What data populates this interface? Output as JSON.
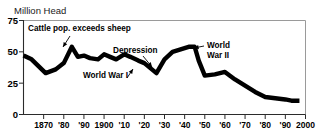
{
  "chart_data": {
    "type": "line",
    "title": "Million Head",
    "xlabel": "",
    "ylabel": "Million Head",
    "xlim": [
      1860,
      2000
    ],
    "ylim": [
      0,
      75
    ],
    "grid": false,
    "legend": null,
    "yticks": [
      0,
      25,
      50,
      75
    ],
    "ytick_labels": [
      "0",
      "25",
      "50",
      "75"
    ],
    "xticks": [
      1870,
      1880,
      1890,
      1900,
      1910,
      1920,
      1930,
      1940,
      1950,
      1960,
      1970,
      1980,
      1990,
      2000
    ],
    "xtick_labels": [
      "1870",
      "'80",
      "'90",
      "1900",
      "'10",
      "'20",
      "'30",
      "'40",
      "'50",
      "'60",
      "'70",
      "'80",
      "'90",
      "2000"
    ],
    "series": [
      {
        "name": "Sheep population",
        "color": "#000000",
        "x": [
          1860,
          1864,
          1871,
          1876,
          1880,
          1884,
          1887,
          1890,
          1893,
          1897,
          1900,
          1903,
          1906,
          1910,
          1913,
          1917,
          1920,
          1923,
          1926,
          1930,
          1934,
          1938,
          1942,
          1945,
          1947,
          1950,
          1955,
          1960,
          1965,
          1970,
          1975,
          1980,
          1985,
          1990,
          1993,
          1997
        ],
        "y": [
          47,
          44,
          33,
          36,
          41,
          54,
          46,
          47,
          45,
          44,
          48,
          46,
          44,
          48,
          46,
          43,
          41,
          37,
          33,
          44,
          50,
          52,
          54,
          54,
          43,
          31,
          32,
          34,
          28,
          23,
          18,
          14,
          13,
          12,
          11,
          11
        ]
      }
    ],
    "annotations": [
      {
        "id": "cattle-exceeds-sheep",
        "text": "Cattle pop. exceeds sheep",
        "text_x": 28,
        "text_y": 31,
        "arrow_from_x": 70,
        "arrow_from_y": 36,
        "arrow_to_x": 63,
        "arrow_to_y": 47
      },
      {
        "id": "depression",
        "text": "Depression",
        "text_x": 113,
        "text_y": 53,
        "arrow_from_x": 143,
        "arrow_from_y": 56,
        "arrow_to_x": 152,
        "arrow_to_y": 67
      },
      {
        "id": "world-war-1",
        "text": "World War I",
        "text_x": 83,
        "text_y": 78,
        "arrow_from_x": 127,
        "arrow_from_y": 78,
        "arrow_to_x": 133,
        "arrow_to_y": 69
      },
      {
        "id": "world-war-2-line-1",
        "text": "World",
        "text_x": 207,
        "text_y": 48,
        "arrow_from_x": 204,
        "arrow_from_y": 46,
        "arrow_to_x": 194,
        "arrow_to_y": 48
      },
      {
        "id": "world-war-2-line-2",
        "text": "War II",
        "text_x": 207,
        "text_y": 58,
        "arrow_from_x": null,
        "arrow_from_y": null,
        "arrow_to_x": null,
        "arrow_to_y": null
      }
    ]
  },
  "axis_title": "Million Head",
  "colors": {
    "line": "#000000",
    "axis": "#2b2b2b",
    "frame": "#9a9a9a",
    "background": "#ffffff"
  }
}
